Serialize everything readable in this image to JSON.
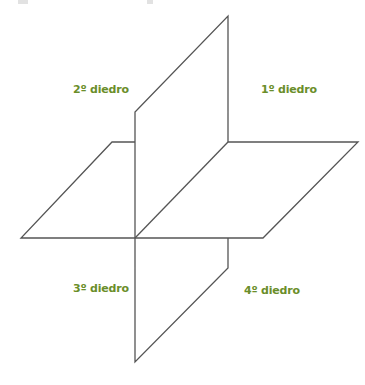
{
  "diagram": {
    "line_color": "#555555",
    "label_color": "#6a8e2a",
    "labels": {
      "q1": "1º diedro",
      "q2": "2º diedro",
      "q3": "3º diedro",
      "q4": "4º diedro"
    }
  }
}
